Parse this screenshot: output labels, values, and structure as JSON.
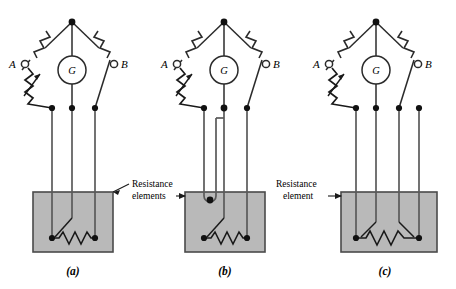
{
  "figure": {
    "title": "",
    "background": "#ffffff",
    "colors": {
      "wire": "#3a3a3a",
      "wire_dark": "#1a1a1a",
      "node": "#111111",
      "box_fill": "#b9b9b9",
      "box_stroke": "#4a4a4a",
      "text": "#000000"
    }
  },
  "panels": [
    {
      "id": "a",
      "caption": "(a)",
      "terminal_a_label": "A",
      "terminal_b_label": "B",
      "galvanometer_label": "G",
      "lead_count": 3,
      "element_terminals": 2,
      "annotation": "Resistance\nelements"
    },
    {
      "id": "b",
      "caption": "(b)",
      "terminal_a_label": "A",
      "terminal_b_label": "B",
      "galvanometer_label": "G",
      "lead_count": 4,
      "element_terminals": 2,
      "annotation": "Resistance\nelements"
    },
    {
      "id": "c",
      "caption": "(c)",
      "terminal_a_label": "A",
      "terminal_b_label": "B",
      "galvanometer_label": "G",
      "lead_count": 4,
      "element_terminals": 2,
      "annotation": "Resistance\nelement"
    }
  ],
  "annotations": {
    "ab_line1": "Resistance",
    "ab_line2": "elements",
    "c_line1": "Resistance",
    "c_line2": "element"
  },
  "labels": {
    "terminal_a": "A",
    "terminal_b": "B",
    "galvanometer": "G",
    "caption_a": "(a)",
    "caption_b": "(b)",
    "caption_c": "(c)"
  }
}
